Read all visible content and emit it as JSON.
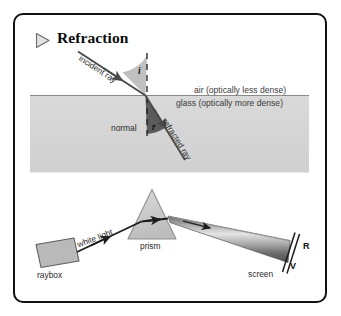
{
  "figure": {
    "title": "Refraction",
    "bullet_icon": "play-triangle-icon"
  },
  "diagram_refraction": {
    "incident_ray_label": "incident ray",
    "angle_of_incidence_label": "i",
    "angle_of_refraction_label": "r",
    "normal_label": "normal",
    "refracted_ray_label": "refracted ray",
    "air_label": "air (optically less dense)",
    "glass_label": "glass (optically more dense)"
  },
  "diagram_prism": {
    "raybox_label": "raybox",
    "white_light_label": "white light",
    "prism_label": "prism",
    "screen_label": "screen",
    "red_label": "R",
    "violet_label": "V"
  },
  "colors": {
    "border": "#111111",
    "background": "#ffffff",
    "glass_fill": "#d4d4d4",
    "angle_fill_light": "#b4b4b4",
    "angle_fill_dark": "#575757",
    "ray_stroke": "#4a4a4a",
    "prism_fill": "#c9c9c9",
    "raybox_fill": "#b8b8b8",
    "beam_light": "#d8d8d8",
    "beam_dark": "#5a5a5a",
    "text": "#2b2b2b"
  }
}
